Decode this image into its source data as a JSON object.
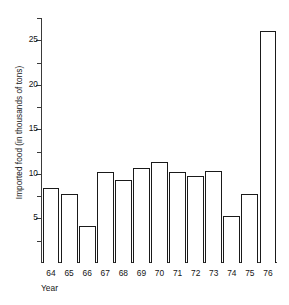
{
  "chart_data": {
    "type": "bar",
    "title": "",
    "xlabel": "Year",
    "ylabel": "Imported food (in thousands of tons)",
    "categories": [
      "64",
      "65",
      "66",
      "67",
      "68",
      "69",
      "70",
      "71",
      "72",
      "73",
      "74",
      "75",
      "76"
    ],
    "values": [
      8.4,
      7.7,
      4.2,
      10.2,
      9.3,
      10.7,
      11.3,
      10.2,
      9.8,
      10.3,
      5.3,
      7.7,
      26.0
    ],
    "ylim": [
      0,
      27.5
    ],
    "yticks": [
      5,
      10,
      15,
      20,
      25
    ],
    "ytick_labels": [
      "5",
      "10",
      "15",
      "20",
      "25"
    ],
    "yminor_ticks": [
      2.5,
      7.5,
      12.5,
      17.5,
      22.5,
      27.5
    ],
    "grid": false,
    "legend": null,
    "bar_edge_color": "#1a1a1a",
    "bar_fill_color": "#ffffff",
    "axis_color": "#3a3a3a"
  }
}
